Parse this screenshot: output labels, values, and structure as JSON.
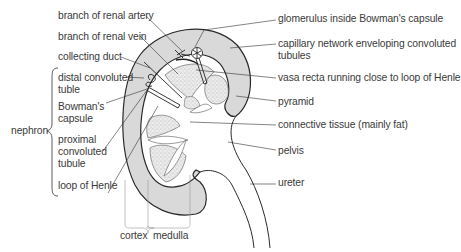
{
  "diagram": {
    "colors": {
      "cortex_fill": "#d9d9d9",
      "pyramid_fill": "#e6e6e6",
      "outline": "#2a2a2a",
      "text": "#3a3a3a",
      "background": "#ffffff"
    },
    "labels_left": [
      {
        "id": "branch-renal-artery",
        "text": "branch of renal artery"
      },
      {
        "id": "branch-renal-vein",
        "text": "branch of renal vein"
      },
      {
        "id": "collecting-duct",
        "text": "collecting duct"
      },
      {
        "id": "distal-convoluted-tubule",
        "line1": "distal convoluted",
        "line2": "tuble"
      },
      {
        "id": "bowmans-capsule",
        "line1": "Bowman's",
        "line2": "capsule"
      },
      {
        "id": "proximal-convoluted-tubule",
        "line1": "proximal",
        "line2": "convoluted",
        "line3": "tubule"
      },
      {
        "id": "loop-of-henle",
        "text": "loop of Henle"
      }
    ],
    "group_label": {
      "id": "nephron",
      "text": "nephron"
    },
    "labels_right": [
      {
        "id": "glomerulus",
        "text": "glomerulus inside Bowman's capsule"
      },
      {
        "id": "capillary-network",
        "line1": "capillary network enveloping convoluted",
        "line2": "tubules"
      },
      {
        "id": "vasa-recta",
        "text": "vasa recta running close to loop of Henle"
      },
      {
        "id": "pyramid",
        "text": "pyramid"
      },
      {
        "id": "connective-tissue",
        "text": "connective tissue (mainly fat)"
      },
      {
        "id": "pelvis",
        "text": "pelvis"
      },
      {
        "id": "ureter",
        "text": "ureter"
      }
    ],
    "labels_bottom": [
      {
        "id": "cortex",
        "text": "cortex"
      },
      {
        "id": "medulla",
        "text": "medulla"
      }
    ]
  }
}
